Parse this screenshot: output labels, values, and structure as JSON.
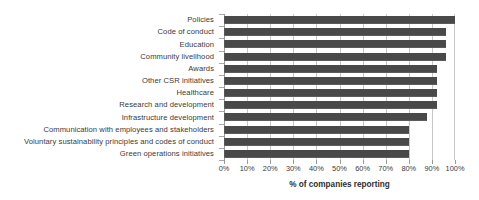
{
  "chart_data": {
    "type": "bar",
    "orientation": "horizontal",
    "title": "",
    "subtitle": "",
    "xlabel": "% of companies reporting",
    "ylabel": "",
    "xlim": [
      0,
      100
    ],
    "grid": true,
    "legend": false,
    "legend_position": "none",
    "bar_color": "#494949",
    "gridline_color": "#c8c8c8",
    "axis_color": "#9a9a9a",
    "text_color": "#3a3a3a",
    "categories": [
      "Policies",
      "Code of conduct",
      "Education",
      "Community livelihood",
      "Awards",
      "Other CSR initiatives",
      "Healthcare",
      "Research and development",
      "Infrastructure development",
      "Communication with employees and stakeholders",
      "Voluntary sustainability principles and codes of conduct",
      "Green operations initiatives"
    ],
    "values": [
      100,
      96,
      96,
      96,
      92,
      92,
      92,
      92,
      88,
      80,
      80,
      80
    ],
    "x_ticks": [
      0,
      10,
      20,
      30,
      40,
      50,
      60,
      70,
      80,
      90,
      100
    ],
    "x_tick_labels": [
      "0%",
      "10%",
      "20%",
      "30%",
      "40%",
      "50%",
      "60%",
      "70%",
      "80%",
      "90%",
      "100%"
    ]
  }
}
